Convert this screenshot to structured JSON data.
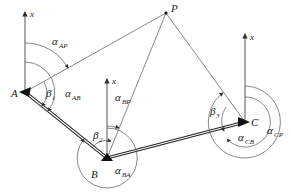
{
  "diagram": {
    "type": "surveying traverse angle diagram",
    "points": {
      "A": {
        "label": "A",
        "x": 25,
        "y": 92
      },
      "B": {
        "label": "B",
        "x": 107,
        "y": 158
      },
      "C": {
        "label": "C",
        "x": 245,
        "y": 122
      },
      "P": {
        "label": "P",
        "x": 166,
        "y": 13
      }
    },
    "axis_label": "x",
    "angles": {
      "alpha_AP": {
        "sym": "α",
        "sub": "AP"
      },
      "alpha_AB": {
        "sym": "α",
        "sub": "AB"
      },
      "alpha_BP": {
        "sym": "α",
        "sub": "BP"
      },
      "alpha_BA": {
        "sym": "α",
        "sub": "BA"
      },
      "alpha_CB": {
        "sym": "α",
        "sub": "CB"
      },
      "alpha_CP": {
        "sym": "α",
        "sub": "CP"
      },
      "beta_1": {
        "sym": "β",
        "sub": "1"
      },
      "beta_2": {
        "sym": "β",
        "sub": "2"
      },
      "beta_3": {
        "sym": "β",
        "sub": "3"
      }
    }
  }
}
